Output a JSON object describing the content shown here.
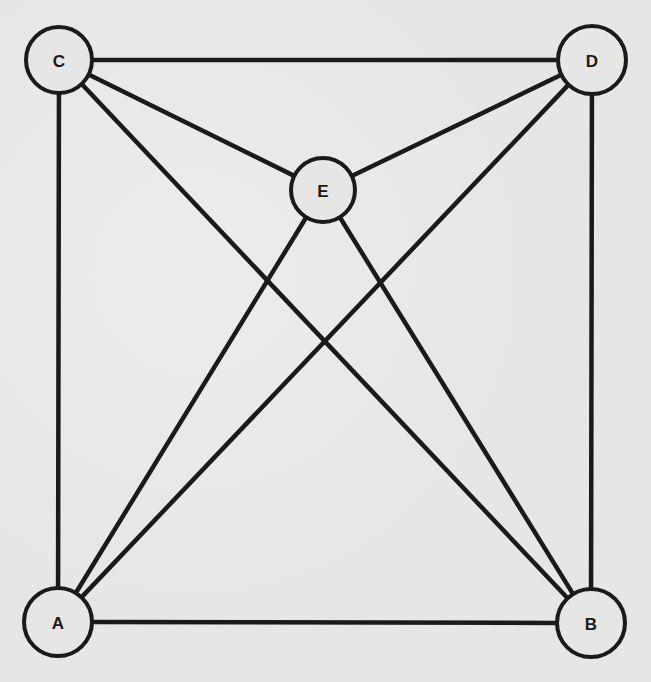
{
  "diagram": {
    "type": "graph",
    "nodes": [
      {
        "id": "A",
        "label": "A",
        "cx": 58,
        "cy": 622,
        "r": 34
      },
      {
        "id": "B",
        "label": "B",
        "cx": 591,
        "cy": 623,
        "r": 34
      },
      {
        "id": "C",
        "label": "C",
        "cx": 59,
        "cy": 60,
        "r": 33
      },
      {
        "id": "D",
        "label": "D",
        "cx": 592,
        "cy": 60,
        "r": 34
      },
      {
        "id": "E",
        "label": "E",
        "cx": 323,
        "cy": 190,
        "r": 32
      }
    ],
    "edges": [
      {
        "from": "C",
        "to": "D"
      },
      {
        "from": "C",
        "to": "A"
      },
      {
        "from": "D",
        "to": "B"
      },
      {
        "from": "A",
        "to": "B"
      },
      {
        "from": "C",
        "to": "E"
      },
      {
        "from": "D",
        "to": "E"
      },
      {
        "from": "C",
        "to": "B"
      },
      {
        "from": "D",
        "to": "A"
      },
      {
        "from": "E",
        "to": "A"
      },
      {
        "from": "E",
        "to": "B"
      }
    ],
    "colors": {
      "background": "#e6e6e4",
      "stroke": "#1a1a1a"
    }
  }
}
